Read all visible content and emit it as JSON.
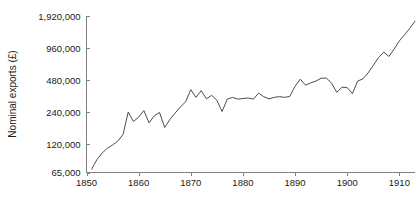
{
  "chart_data": {
    "type": "line",
    "title": "",
    "xlabel": "",
    "ylabel": "Nominal exports (£)",
    "yscale": "log",
    "grid": false,
    "legend": false,
    "xlim": [
      1850,
      1913
    ],
    "ylim": [
      65000,
      1920000
    ],
    "ytick_labels": [
      "1,920,000",
      "960,000",
      "480,000",
      "240,000",
      "120,000",
      "65,000"
    ],
    "ytick_values": [
      1920000,
      960000,
      480000,
      240000,
      120000,
      65000
    ],
    "xtick_labels": [
      "1850",
      "1860",
      "1870",
      "1880",
      "1890",
      "1900",
      "1910"
    ],
    "xtick_values": [
      1850,
      1860,
      1870,
      1880,
      1890,
      1900,
      1910
    ],
    "series": [
      {
        "name": "Nominal exports",
        "color": "#4d4d4d",
        "x": [
          1851,
          1852,
          1853,
          1854,
          1855,
          1856,
          1857,
          1858,
          1859,
          1860,
          1861,
          1862,
          1863,
          1864,
          1865,
          1866,
          1867,
          1868,
          1869,
          1870,
          1871,
          1872,
          1873,
          1874,
          1875,
          1876,
          1877,
          1878,
          1879,
          1880,
          1881,
          1882,
          1883,
          1884,
          1885,
          1886,
          1887,
          1888,
          1889,
          1890,
          1891,
          1892,
          1893,
          1894,
          1895,
          1896,
          1897,
          1898,
          1899,
          1900,
          1901,
          1902,
          1903,
          1904,
          1905,
          1906,
          1907,
          1908,
          1909,
          1910,
          1911,
          1912,
          1913
        ],
        "values": [
          70000,
          86000,
          99000,
          110000,
          118000,
          128000,
          148000,
          240000,
          196000,
          215000,
          248000,
          190000,
          222000,
          238000,
          172000,
          205000,
          235000,
          268000,
          300000,
          390000,
          330000,
          382000,
          320000,
          345000,
          310000,
          243000,
          318000,
          330000,
          318000,
          322000,
          326000,
          318000,
          362000,
          335000,
          320000,
          330000,
          336000,
          330000,
          338000,
          420000,
          490000,
          430000,
          452000,
          470000,
          500000,
          502000,
          448000,
          368000,
          412000,
          408000,
          358000,
          470000,
          492000,
          560000,
          660000,
          780000,
          880000,
          800000,
          940000,
          1120000,
          1280000,
          1470000,
          1720000
        ]
      }
    ]
  },
  "axis": {
    "ylabel": "Nominal exports (£)"
  }
}
